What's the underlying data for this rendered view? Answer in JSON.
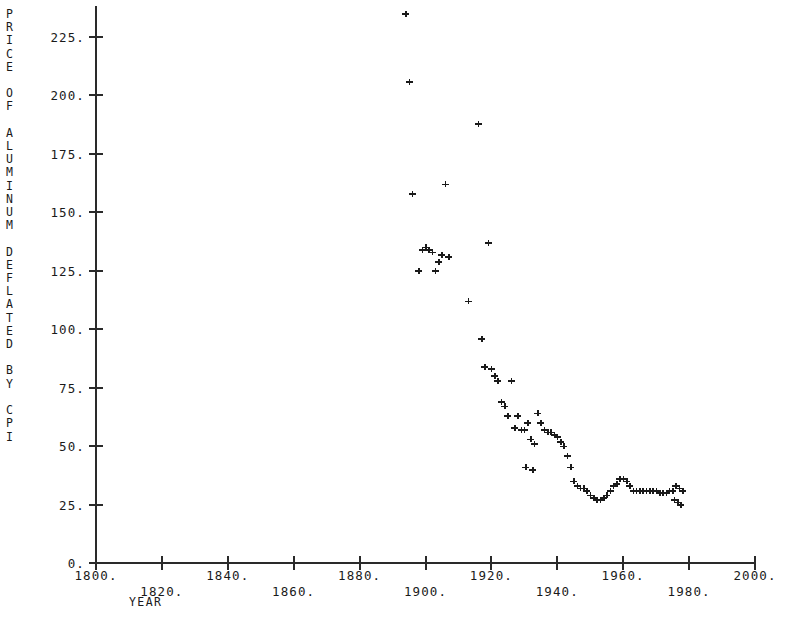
{
  "chart_data": {
    "type": "scatter",
    "title": "",
    "ylabel": "PRICE OF ALUMINUM DEFLATED BY CPI",
    "xlabel": "YEAR",
    "xlim": [
      1800,
      2000
    ],
    "ylim": [
      0,
      237
    ],
    "grid": false,
    "legend": "none",
    "marker": "plus",
    "xticks": [
      1800,
      1820,
      1840,
      1860,
      1880,
      1900,
      1920,
      1940,
      1960,
      1980,
      2000
    ],
    "xtick_labels": [
      "1800.",
      "1820.",
      "1840.",
      "1860.",
      "1880.",
      "1900.",
      "1920.",
      "1940.",
      "1960.",
      "1980.",
      "2000."
    ],
    "yticks": [
      0,
      25,
      50,
      75,
      100,
      125,
      150,
      175,
      200,
      225
    ],
    "ytick_labels": [
      "0.",
      "25.",
      "50.",
      "75.",
      "100.",
      "125.",
      "150.",
      "175.",
      "200.",
      "225."
    ],
    "series_name": "Price of aluminum deflated by CPI",
    "points": [
      {
        "x": 1894,
        "y": 235
      },
      {
        "x": 1895,
        "y": 206
      },
      {
        "x": 1916,
        "y": 188
      },
      {
        "x": 1906,
        "y": 162
      },
      {
        "x": 1896,
        "y": 158
      },
      {
        "x": 1919,
        "y": 137
      },
      {
        "x": 1900,
        "y": 135
      },
      {
        "x": 1901,
        "y": 134
      },
      {
        "x": 1899,
        "y": 134
      },
      {
        "x": 1902,
        "y": 133
      },
      {
        "x": 1905,
        "y": 132
      },
      {
        "x": 1907,
        "y": 131
      },
      {
        "x": 1904,
        "y": 129
      },
      {
        "x": 1898,
        "y": 125
      },
      {
        "x": 1903,
        "y": 125
      },
      {
        "x": 1913,
        "y": 112
      },
      {
        "x": 1917,
        "y": 96
      },
      {
        "x": 1918,
        "y": 84
      },
      {
        "x": 1920,
        "y": 83
      },
      {
        "x": 1921,
        "y": 80
      },
      {
        "x": 1922,
        "y": 78
      },
      {
        "x": 1926,
        "y": 78
      },
      {
        "x": 1923,
        "y": 69
      },
      {
        "x": 1924,
        "y": 67
      },
      {
        "x": 1925,
        "y": 63
      },
      {
        "x": 1928,
        "y": 63
      },
      {
        "x": 1934,
        "y": 64
      },
      {
        "x": 1931,
        "y": 60
      },
      {
        "x": 1935,
        "y": 60
      },
      {
        "x": 1927,
        "y": 58
      },
      {
        "x": 1929,
        "y": 57
      },
      {
        "x": 1930,
        "y": 57
      },
      {
        "x": 1936,
        "y": 57
      },
      {
        "x": 1937,
        "y": 56
      },
      {
        "x": 1938,
        "y": 56
      },
      {
        "x": 1939,
        "y": 55
      },
      {
        "x": 1940,
        "y": 54
      },
      {
        "x": 1932,
        "y": 53
      },
      {
        "x": 1941,
        "y": 52
      },
      {
        "x": 1933,
        "y": 51
      },
      {
        "x": 1942,
        "y": 50
      },
      {
        "x": 1943,
        "y": 46
      },
      {
        "x": 1930.5,
        "y": 41
      },
      {
        "x": 1932.5,
        "y": 40
      },
      {
        "x": 1944,
        "y": 41
      },
      {
        "x": 1945,
        "y": 35
      },
      {
        "x": 1946,
        "y": 33
      },
      {
        "x": 1947,
        "y": 32
      },
      {
        "x": 1948,
        "y": 32
      },
      {
        "x": 1949,
        "y": 31
      },
      {
        "x": 1950,
        "y": 29
      },
      {
        "x": 1951,
        "y": 28
      },
      {
        "x": 1952,
        "y": 27
      },
      {
        "x": 1953,
        "y": 27
      },
      {
        "x": 1954,
        "y": 28
      },
      {
        "x": 1955,
        "y": 29
      },
      {
        "x": 1956,
        "y": 31
      },
      {
        "x": 1957,
        "y": 33
      },
      {
        "x": 1958,
        "y": 34
      },
      {
        "x": 1959,
        "y": 36
      },
      {
        "x": 1960,
        "y": 36
      },
      {
        "x": 1961,
        "y": 35
      },
      {
        "x": 1962,
        "y": 33
      },
      {
        "x": 1963,
        "y": 31
      },
      {
        "x": 1964,
        "y": 31
      },
      {
        "x": 1965,
        "y": 31
      },
      {
        "x": 1966,
        "y": 31
      },
      {
        "x": 1967,
        "y": 31
      },
      {
        "x": 1968,
        "y": 31
      },
      {
        "x": 1969,
        "y": 31
      },
      {
        "x": 1970,
        "y": 31
      },
      {
        "x": 1971,
        "y": 30
      },
      {
        "x": 1972,
        "y": 30
      },
      {
        "x": 1973,
        "y": 30
      },
      {
        "x": 1974,
        "y": 31
      },
      {
        "x": 1975,
        "y": 31
      },
      {
        "x": 1976,
        "y": 33
      },
      {
        "x": 1977,
        "y": 32
      },
      {
        "x": 1978,
        "y": 31
      },
      {
        "x": 1975.5,
        "y": 27
      },
      {
        "x": 1976.5,
        "y": 26
      },
      {
        "x": 1977.5,
        "y": 25
      }
    ]
  }
}
